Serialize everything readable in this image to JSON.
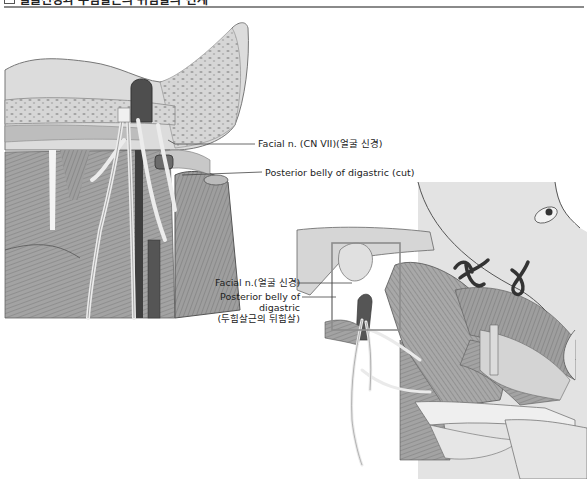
{
  "figure": {
    "title": "얼굴신경과 두힘살근의 뒤힘살의 관계",
    "left_panel": {
      "labels": [
        {
          "id": "facial-nerve",
          "text": "Facial n. (CN VII)(얼굴 신경)"
        },
        {
          "id": "posterior-belly",
          "text": "Posterior belly of digastric (cut)"
        }
      ]
    },
    "right_panel": {
      "labels": [
        {
          "id": "facial-nerve",
          "text": "Facial n.(얼굴 신경)"
        },
        {
          "id": "posterior-belly-line1",
          "text": "Posterior belly of"
        },
        {
          "id": "posterior-belly-line2",
          "text": "digastric"
        },
        {
          "id": "posterior-belly-line3",
          "text": "(두힘살근의 뒤힘살)"
        }
      ]
    }
  },
  "colors": {
    "bone": "#d9d9d9",
    "bone_dots": "#a8a8a8",
    "muscle": "#9a9a9a",
    "muscle_dark": "#6e6e6e",
    "nerve": "#e8e8e8",
    "vessel": "#4a4a4a",
    "skin": "#e6e6e6",
    "outline": "#555555",
    "leader": "#444444",
    "highlight_box": "#8c8c8c"
  }
}
